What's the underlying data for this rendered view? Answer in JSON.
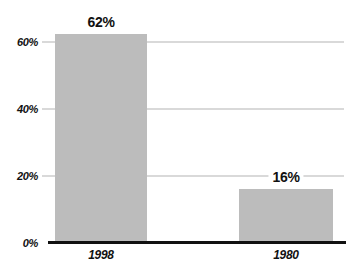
{
  "chart_data": {
    "type": "bar",
    "title": "",
    "xlabel": "",
    "ylabel": "",
    "categories": [
      "1998",
      "1980"
    ],
    "values": [
      62,
      16
    ],
    "value_labels": [
      "62%",
      "16%"
    ],
    "y_ticks": [
      {
        "label": "60%",
        "value": 60
      },
      {
        "label": "40%",
        "value": 40
      },
      {
        "label": "20%",
        "value": 20
      },
      {
        "label": "0%",
        "value": 0
      }
    ],
    "ylim": [
      0,
      65
    ],
    "grid": "horizontal",
    "legend": "none",
    "colors": {
      "bar": "#bcbcbc",
      "gridline": "#d9d9d9",
      "axis_line": "#111111",
      "text": "#111111"
    }
  }
}
